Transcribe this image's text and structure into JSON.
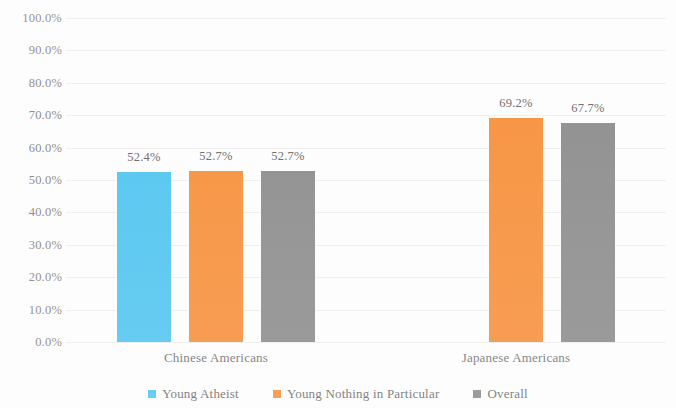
{
  "chart_data": {
    "type": "bar",
    "title": "",
    "subtitle": "",
    "xlabel": "",
    "ylabel": "",
    "categories": [
      "Chinese Americans",
      "Japanese Americans"
    ],
    "series": [
      {
        "name": "Young Atheist",
        "color": "#5BC8F0",
        "values": [
          52.4,
          null
        ],
        "labels": [
          "52.4%",
          ""
        ]
      },
      {
        "name": "Young Nothing in Particular",
        "color": "#F79646",
        "values": [
          52.7,
          69.2
        ],
        "labels": [
          "52.7%",
          "69.2%"
        ]
      },
      {
        "name": "Overall",
        "color": "#939393",
        "values": [
          52.7,
          67.7
        ],
        "labels": [
          "52.7%",
          "67.7%"
        ]
      }
    ],
    "ylim": [
      0,
      100
    ],
    "ytick_labels": [
      "100.0%",
      "90.0%",
      "80.0%",
      "70.0%",
      "60.0%",
      "50.0%",
      "40.0%",
      "30.0%",
      "20.0%",
      "10.0%",
      "0.0%"
    ],
    "ytick_values": [
      100,
      90,
      80,
      70,
      60,
      50,
      40,
      30,
      20,
      10,
      0
    ],
    "grid": true,
    "legend_position": "bottom"
  },
  "legend": {
    "items": [
      {
        "label": "Young Atheist",
        "color": "#5BC8F0"
      },
      {
        "label": "Young Nothing in Particular",
        "color": "#F79646"
      },
      {
        "label": "Overall",
        "color": "#939393"
      }
    ]
  }
}
